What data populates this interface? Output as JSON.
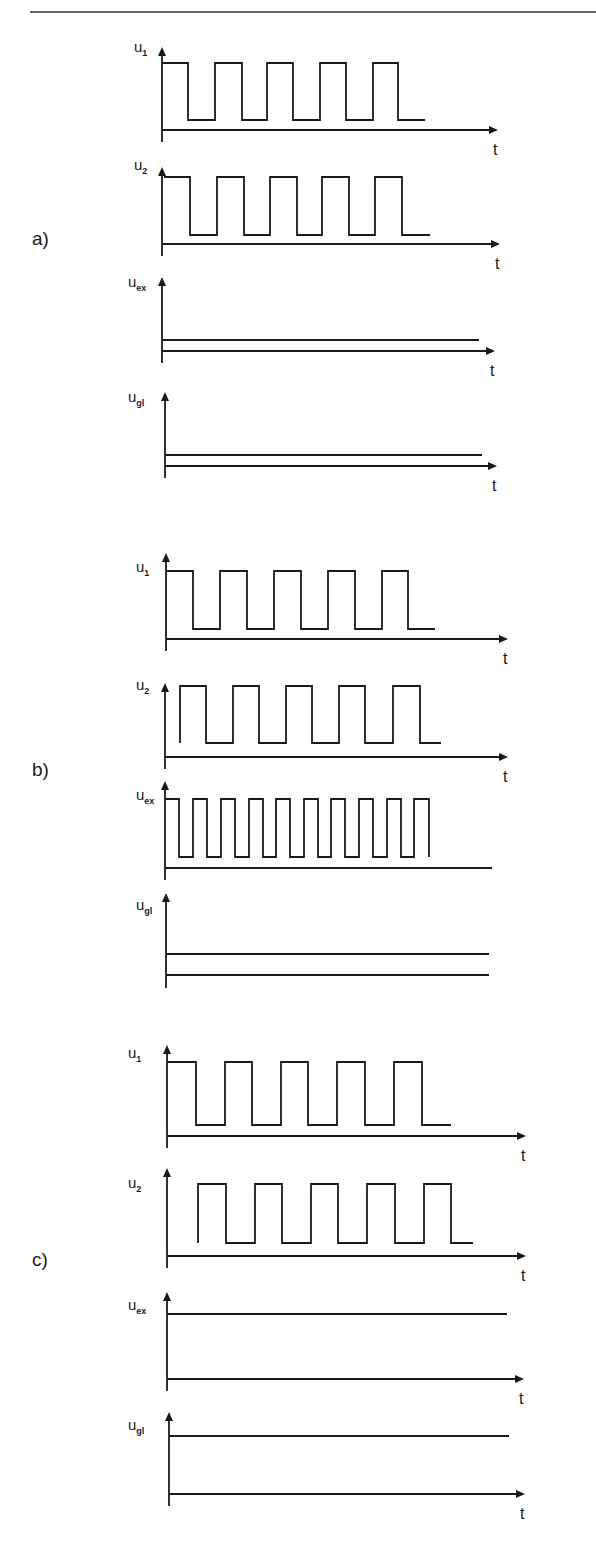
{
  "header": {
    "rule_visible": true
  },
  "parts": [
    {
      "label": "a)",
      "label_y": 245
    },
    {
      "label": "b)",
      "label_y": 776
    },
    {
      "label": "c)",
      "label_y": 1266
    }
  ],
  "time_axis_label": "t",
  "chart_data": [
    {
      "type": "line",
      "part": "a)",
      "signal": "u1",
      "ylabel_main": "u",
      "ylabel_sub": "1",
      "xlabel": "t",
      "description": "Square wave, 5 pulses, starts high",
      "axis": {
        "x": 162,
        "top": 47,
        "taxis_y": 130,
        "taxis_end": 498,
        "arrow": true,
        "t_label": true
      },
      "label_pos": [
        134,
        52
      ],
      "high_y": 63,
      "low_y": 120,
      "edges": [
        162,
        188,
        215,
        242,
        267,
        293,
        320,
        346,
        373,
        398,
        425
      ],
      "start_level": "high"
    },
    {
      "type": "line",
      "part": "a)",
      "signal": "u2",
      "ylabel_main": "u",
      "ylabel_sub": "2",
      "xlabel": "t",
      "description": "Square wave in phase with u1",
      "axis": {
        "x": 162,
        "top": 167,
        "taxis_y": 244,
        "taxis_end": 500,
        "arrow": true,
        "t_label": true
      },
      "label_pos": [
        134,
        170
      ],
      "high_y": 177,
      "low_y": 235,
      "edges": [
        164,
        190,
        217,
        244,
        270,
        297,
        322,
        349,
        375,
        402,
        430
      ],
      "start_level": "high"
    },
    {
      "type": "line",
      "part": "a)",
      "signal": "uex",
      "ylabel_main": "u",
      "ylabel_sub": "ex",
      "xlabel": "t",
      "description": "Constant low level",
      "axis": {
        "x": 162,
        "top": 277,
        "taxis_y": 351,
        "taxis_end": 495,
        "arrow": true,
        "t_label": true
      },
      "label_pos": [
        128,
        287
      ],
      "levels": [
        {
          "y": 340,
          "x_end": 479
        }
      ]
    },
    {
      "type": "line",
      "part": "a)",
      "signal": "ugl",
      "ylabel_main": "u",
      "ylabel_sub": "gl",
      "xlabel": "t",
      "description": "Constant low level",
      "axis": {
        "x": 165,
        "top": 392,
        "taxis_y": 466,
        "taxis_end": 497,
        "arrow": true,
        "t_label": true
      },
      "label_pos": [
        128,
        402
      ],
      "levels": [
        {
          "y": 455,
          "x_end": 482
        }
      ]
    },
    {
      "type": "line",
      "part": "b)",
      "signal": "u1",
      "ylabel_main": "u",
      "ylabel_sub": "1",
      "xlabel": "t",
      "description": "Square wave, 5 pulses, starts high",
      "axis": {
        "x": 166,
        "top": 553,
        "taxis_y": 639,
        "taxis_end": 508,
        "arrow": true,
        "t_label": true
      },
      "label_pos": [
        136,
        572
      ],
      "high_y": 571,
      "low_y": 629,
      "edges": [
        166,
        193,
        220,
        247,
        274,
        301,
        328,
        355,
        382,
        408,
        435
      ],
      "start_level": "high"
    },
    {
      "type": "line",
      "part": "b)",
      "signal": "u2",
      "ylabel_main": "u",
      "ylabel_sub": "2",
      "xlabel": "t",
      "description": "Square wave shifted by half a pulse width relative to u1",
      "axis": {
        "x": 165,
        "top": 683,
        "taxis_y": 757,
        "taxis_end": 508,
        "arrow": true,
        "t_label": true
      },
      "label_pos": [
        136,
        690
      ],
      "high_y": 686,
      "low_y": 743,
      "edges": [
        180,
        206,
        233,
        259,
        286,
        312,
        339,
        365,
        393,
        420,
        441
      ],
      "start_level": "low"
    },
    {
      "type": "line",
      "part": "b)",
      "signal": "uex",
      "ylabel_main": "u",
      "ylabel_sub": "ex",
      "xlabel": "",
      "description": "Square wave at double frequency, 10 pulses",
      "axis": {
        "x": 165,
        "top": 781,
        "taxis_y": 868,
        "taxis_end": 492,
        "arrow": false,
        "t_label": false
      },
      "label_pos": [
        136,
        800
      ],
      "high_y": 799,
      "low_y": 857,
      "edges": [
        165,
        179,
        193,
        207,
        221,
        235,
        249,
        263,
        276,
        290,
        304,
        318,
        331,
        345,
        359,
        373,
        387,
        401,
        414,
        429
      ],
      "start_level": "high",
      "end_level": "low_stub"
    },
    {
      "type": "line",
      "part": "b)",
      "signal": "ugl",
      "ylabel_main": "u",
      "ylabel_sub": "gl",
      "xlabel": "",
      "description": "Constant level plus baseline",
      "axis": {
        "x": 166,
        "top": 893,
        "taxis_y": 975,
        "taxis_end": 489,
        "arrow": false,
        "t_label": false,
        "bottom": 988
      },
      "label_pos": [
        136,
        910
      ],
      "levels": [
        {
          "y": 954,
          "x_end": 489
        }
      ]
    },
    {
      "type": "line",
      "part": "c)",
      "signal": "u1",
      "ylabel_main": "u",
      "ylabel_sub": "1",
      "xlabel": "t",
      "description": "Square wave, 5 pulses, starts high",
      "axis": {
        "x": 167,
        "top": 1045,
        "taxis_y": 1136,
        "taxis_end": 526,
        "arrow": true,
        "t_label": true
      },
      "label_pos": [
        128,
        1058
      ],
      "high_y": 1062,
      "low_y": 1125,
      "edges": [
        167,
        196,
        225,
        252,
        281,
        308,
        337,
        365,
        394,
        422,
        451
      ],
      "start_level": "high"
    },
    {
      "type": "line",
      "part": "c)",
      "signal": "u2",
      "ylabel_main": "u",
      "ylabel_sub": "2",
      "xlabel": "t",
      "description": "Square wave shifted (complementary-phase start)",
      "axis": {
        "x": 167,
        "top": 1168,
        "taxis_y": 1256,
        "taxis_end": 526,
        "arrow": true,
        "t_label": true
      },
      "label_pos": [
        128,
        1188
      ],
      "high_y": 1184,
      "low_y": 1243,
      "edges": [
        198,
        226,
        255,
        282,
        311,
        338,
        367,
        395,
        424,
        451,
        473
      ],
      "start_level": "low"
    },
    {
      "type": "line",
      "part": "c)",
      "signal": "uex",
      "ylabel_main": "u",
      "ylabel_sub": "ex",
      "xlabel": "t",
      "description": "Constant high level",
      "axis": {
        "x": 167,
        "top": 1292,
        "taxis_y": 1379,
        "taxis_end": 524,
        "arrow": true,
        "t_label": true
      },
      "label_pos": [
        128,
        1310
      ],
      "levels": [
        {
          "y": 1314,
          "x_end": 507
        }
      ]
    },
    {
      "type": "line",
      "part": "c)",
      "signal": "ugl",
      "ylabel_main": "u",
      "ylabel_sub": "gl",
      "xlabel": "t",
      "description": "Constant high level",
      "axis": {
        "x": 169,
        "top": 1412,
        "taxis_y": 1494,
        "taxis_end": 525,
        "arrow": true,
        "t_label": true
      },
      "label_pos": [
        128,
        1430
      ],
      "levels": [
        {
          "y": 1436,
          "x_end": 509
        }
      ]
    }
  ]
}
